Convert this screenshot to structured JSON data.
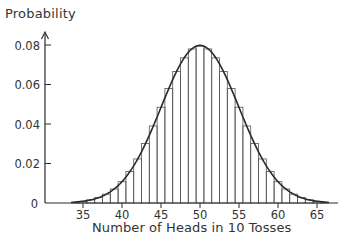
{
  "chart_data": {
    "type": "bar",
    "subtype": "histogram-with-normal-curve",
    "title": "",
    "ylabel": "Probability",
    "xlabel": "Number of Heads in 10 Tosses",
    "xlim": [
      33,
      67
    ],
    "ylim": [
      0,
      0.085
    ],
    "xticks": [
      35,
      40,
      45,
      50,
      55,
      60,
      65
    ],
    "yticks": [
      0,
      0.02,
      0.04,
      0.06,
      0.08
    ],
    "ytick_labels": [
      "0",
      "0.02",
      "0.04",
      "0.06",
      "0.08"
    ],
    "grid": false,
    "legend": null,
    "categories": [
      34,
      35,
      36,
      37,
      38,
      39,
      40,
      41,
      42,
      43,
      44,
      45,
      46,
      47,
      48,
      49,
      50,
      51,
      52,
      53,
      54,
      55,
      56,
      57,
      58,
      59,
      60,
      61,
      62,
      63,
      64,
      65,
      66
    ],
    "values": [
      0.0002,
      0.0009,
      0.0016,
      0.0027,
      0.0045,
      0.0071,
      0.0108,
      0.0159,
      0.0223,
      0.0301,
      0.039,
      0.0485,
      0.058,
      0.0666,
      0.0735,
      0.078,
      0.0796,
      0.078,
      0.0735,
      0.0666,
      0.058,
      0.0485,
      0.039,
      0.0301,
      0.0223,
      0.0159,
      0.0108,
      0.0071,
      0.0045,
      0.0027,
      0.0016,
      0.0009,
      0.0002
    ],
    "curve": {
      "type": "normal",
      "mean": 50,
      "sd": 5
    }
  },
  "labels": {
    "y_axis_title": "Probability",
    "x_axis_title": "Number of Heads in 10 Tosses"
  },
  "colors": {
    "ink": "#2a2a2a",
    "background": "#ffffff"
  }
}
